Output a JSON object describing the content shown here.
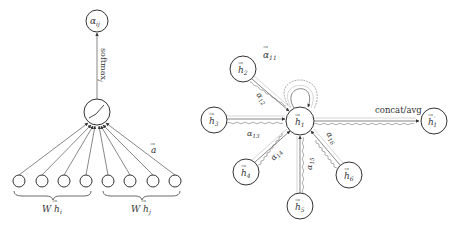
{
  "left_panel": {
    "output_node": {
      "label": "α",
      "sub": "ij"
    },
    "softmax_label": "softmax",
    "softmax_sub": "j",
    "activation_node": {
      "icon": "leaky-relu-icon"
    },
    "weight_vector_label": "a",
    "input_groups": [
      {
        "label": "W h",
        "sub": "i",
        "count": 4
      },
      {
        "label": "W h",
        "sub": "j",
        "count": 4
      }
    ]
  },
  "right_panel": {
    "center_node": {
      "label": "h",
      "sub": "1"
    },
    "neighbors": [
      {
        "label": "h",
        "sub": "2"
      },
      {
        "label": "h",
        "sub": "3"
      },
      {
        "label": "h",
        "sub": "4"
      },
      {
        "label": "h",
        "sub": "5"
      },
      {
        "label": "h",
        "sub": "6"
      }
    ],
    "self_attention": {
      "label": "α",
      "sub": "11"
    },
    "attention_labels": [
      {
        "label": "α",
        "sub": "12"
      },
      {
        "label": "α",
        "sub": "13"
      },
      {
        "label": "α",
        "sub": "14"
      },
      {
        "label": "α",
        "sub": "15"
      },
      {
        "label": "α",
        "sub": "16"
      }
    ],
    "aggregation_label": "concat/avg",
    "output_node": {
      "label": "h",
      "sub": "1",
      "prime": "′"
    }
  }
}
